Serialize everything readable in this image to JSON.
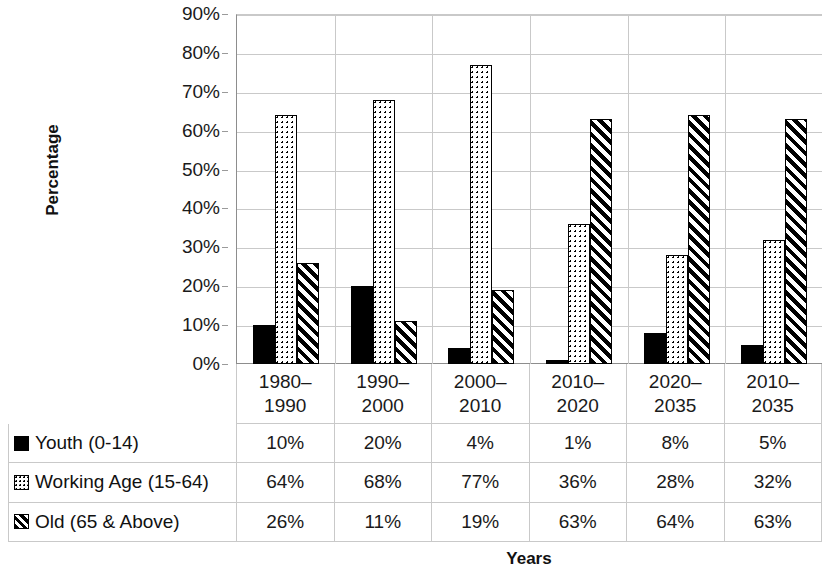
{
  "chart_data": {
    "type": "bar",
    "title": "",
    "xlabel": "Years",
    "ylabel": "Percentage",
    "ylim": [
      0,
      90
    ],
    "ytick_labels": [
      "90%",
      "80%",
      "70%",
      "60%",
      "50%",
      "40%",
      "30%",
      "20%",
      "10%",
      "0%"
    ],
    "ytick_values": [
      90,
      80,
      70,
      60,
      50,
      40,
      30,
      20,
      10,
      0
    ],
    "grid": true,
    "legend_position": "data-table",
    "categories": [
      "1980–1990",
      "1990–2000",
      "2000–2010",
      "2010–2020",
      "2020–2035",
      "2010–2035"
    ],
    "category_lines": [
      [
        "1980–",
        "1990"
      ],
      [
        "1990–",
        "2000"
      ],
      [
        "2000–",
        "2010"
      ],
      [
        "2010–",
        "2020"
      ],
      [
        "2020–",
        "2035"
      ],
      [
        "2010–",
        "2035"
      ]
    ],
    "series": [
      {
        "name": "Youth (0-14)",
        "pattern": "solid-black",
        "values": [
          10,
          20,
          4,
          1,
          8,
          5
        ],
        "labels": [
          "10%",
          "20%",
          "4%",
          "1%",
          "8%",
          "5%"
        ]
      },
      {
        "name": "Working Age (15-64)",
        "pattern": "dotted-white",
        "values": [
          64,
          68,
          77,
          36,
          28,
          32
        ],
        "labels": [
          "64%",
          "68%",
          "77%",
          "36%",
          "28%",
          "32%"
        ]
      },
      {
        "name": "Old (65 & Above)",
        "pattern": "diagonal-hatch",
        "values": [
          26,
          11,
          19,
          63,
          64,
          63
        ],
        "labels": [
          "26%",
          "11%",
          "19%",
          "63%",
          "64%",
          "63%"
        ]
      }
    ]
  },
  "axis": {
    "y_title": "Percentage",
    "x_title": "Years"
  },
  "colors": {
    "ink": "#000000",
    "grid": "#c9c9c9",
    "axis": "#8d8d8d",
    "background": "#ffffff"
  }
}
